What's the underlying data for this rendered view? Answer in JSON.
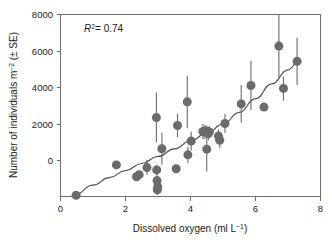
{
  "figure": {
    "background_color": "#ffffff",
    "marker_color": "#6b6b6b",
    "line_color": "#555555",
    "axis_color": "#6e6e6e"
  },
  "annotation": {
    "r_squared_symbol": "R",
    "r_squared_exponent": "2",
    "r_squared_value": "= 0.74",
    "full_text": "R2 = 0.74"
  },
  "axes": {
    "x": {
      "title_main": "Dissolved oxygen (ml L",
      "title_sup": "−1",
      "title_tail": ")",
      "title_full": "Dissolved oxygen (ml L−1)",
      "ticks": [
        "0",
        "2",
        "4",
        "6",
        "8"
      ],
      "tick_values": [
        0,
        2,
        4,
        6,
        8
      ],
      "range": [
        0,
        8
      ]
    },
    "y": {
      "title_pre": "Number of individuals m",
      "title_sup": "−2",
      "title_post": " (± SE)",
      "title_full": "Number of individuals m−2 (± SE)",
      "ticks": [
        "0",
        "2000",
        "4000",
        "6000",
        "8000"
      ],
      "tick_values": [
        0,
        2000,
        4000,
        6000,
        8000
      ],
      "range": [
        0,
        8000
      ]
    }
  },
  "chart_data": {
    "type": "scatter",
    "title": "",
    "subtitle": "",
    "xlabel": "Dissolved oxygen (ml L−1)",
    "ylabel": "Number of individuals m−2 (± SE)",
    "xlim": [
      0,
      8
    ],
    "ylim": [
      0,
      8000
    ],
    "grid": false,
    "legend": null,
    "annotations": [
      {
        "text": "R2 = 0.74",
        "x": 0.75,
        "y": 7550
      }
    ],
    "marker": {
      "shape": "circle",
      "color": "#6b6b6b",
      "size_px": 9
    },
    "error_bars": {
      "direction": "vertical",
      "type": "SE",
      "color": "#6b6b6b"
    },
    "points": [
      {
        "x": 0.48,
        "y": 50,
        "err": 90
      },
      {
        "x": 1.72,
        "y": 1390,
        "err": 0
      },
      {
        "x": 2.34,
        "y": 870,
        "err": 180
      },
      {
        "x": 2.42,
        "y": 960,
        "err": 120
      },
      {
        "x": 2.66,
        "y": 1270,
        "err": 330
      },
      {
        "x": 2.95,
        "y": 3470,
        "err": 1100
      },
      {
        "x": 2.96,
        "y": 1170,
        "err": 230
      },
      {
        "x": 2.97,
        "y": 700,
        "err": 260
      },
      {
        "x": 2.98,
        "y": 290,
        "err": 210
      },
      {
        "x": 2.99,
        "y": 430,
        "err": 180
      },
      {
        "x": 3.12,
        "y": 2100,
        "err": 700
      },
      {
        "x": 3.56,
        "y": 1220,
        "err": 160
      },
      {
        "x": 3.6,
        "y": 3120,
        "err": 520
      },
      {
        "x": 3.9,
        "y": 4160,
        "err": 1160
      },
      {
        "x": 3.92,
        "y": 1830,
        "err": 360
      },
      {
        "x": 4.02,
        "y": 2440,
        "err": 420
      },
      {
        "x": 4.38,
        "y": 2860,
        "err": 330
      },
      {
        "x": 4.44,
        "y": 2830,
        "err": 300
      },
      {
        "x": 4.48,
        "y": 2880,
        "err": 250
      },
      {
        "x": 4.5,
        "y": 2080,
        "err": 980
      },
      {
        "x": 4.55,
        "y": 2770,
        "err": 290
      },
      {
        "x": 4.58,
        "y": 2840,
        "err": 260
      },
      {
        "x": 4.86,
        "y": 2660,
        "err": 280
      },
      {
        "x": 4.9,
        "y": 2470,
        "err": 340
      },
      {
        "x": 5.06,
        "y": 3210,
        "err": 420
      },
      {
        "x": 5.56,
        "y": 4070,
        "err": 830
      },
      {
        "x": 5.86,
        "y": 4880,
        "err": 1080
      },
      {
        "x": 6.26,
        "y": 3930,
        "err": 0
      },
      {
        "x": 6.72,
        "y": 6610,
        "err": 1380
      },
      {
        "x": 6.86,
        "y": 4750,
        "err": 540
      },
      {
        "x": 7.28,
        "y": 5940,
        "err": 1040
      }
    ],
    "fit_curve": {
      "style": "solid",
      "color": "#555555",
      "description": "exponential-like increasing trend line",
      "points": [
        {
          "x": 0.45,
          "y": 90
        },
        {
          "x": 1.0,
          "y": 500
        },
        {
          "x": 1.5,
          "y": 830
        },
        {
          "x": 2.0,
          "y": 1140
        },
        {
          "x": 2.5,
          "y": 1450
        },
        {
          "x": 3.0,
          "y": 1760
        },
        {
          "x": 3.5,
          "y": 2090
        },
        {
          "x": 4.0,
          "y": 2440
        },
        {
          "x": 4.5,
          "y": 2790
        },
        {
          "x": 5.0,
          "y": 3180
        },
        {
          "x": 5.5,
          "y": 3700
        },
        {
          "x": 6.0,
          "y": 4300
        },
        {
          "x": 6.5,
          "y": 4950
        },
        {
          "x": 7.0,
          "y": 5570
        },
        {
          "x": 7.35,
          "y": 5990
        }
      ]
    }
  }
}
